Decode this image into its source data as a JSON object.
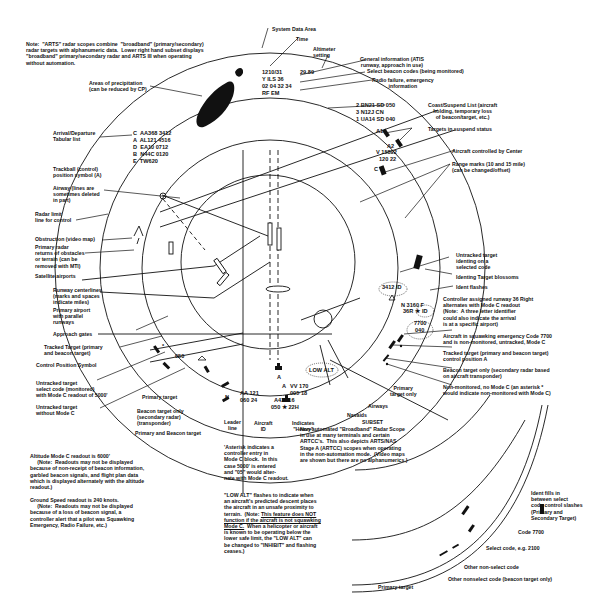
{
  "note": "Note:  \"ARTS\" radar scopes combine  \"broadband\" (primary/secondary)\nradar targets with alphanumeric data.  Lower right hand subset displays\n\"broadband\" primary/secondary radar and ARTS III when operating\nwithout automation.",
  "system_data": {
    "label": "System Data Area",
    "time_label": "Time",
    "altimeter_label": "Altimeter\nsetting",
    "time_value": "1210/31",
    "altimeter_value": "29.89",
    "line2": "Y ILS 36",
    "line3": "02 04 32 34",
    "line4": "RF EM",
    "general_info_label": "General information (ATIS\nrunway, approach in use)",
    "select_codes_label": "Select beacon codes (being monitored)",
    "radio_failure_label": "Radio failure, emergency\ninformation"
  },
  "precipitation_label": "Areas of precipitation\n(can be reduced by CP)",
  "tabular_list": {
    "label": "Arrival/Departure\nTabular list",
    "rows": [
      "C  AA368 3412",
      "A  AL121 4516",
      "D  EA10 0712",
      "B  N44C 0120",
      "E  TW620"
    ]
  },
  "coast_list": {
    "label": "Coast/Suspend List (aircraft\nholding, temporary loss\nof beacon/target, etc.)",
    "rows": [
      "2 BN21 SD 050",
      "3 N12J CN",
      "1 UA14 SD 040"
    ]
  },
  "suspend": {
    "label": "Targets in suspend status",
    "a1": "A1",
    "a2": "A2"
  },
  "center_aircraft": {
    "line1": "V 15892",
    "line2": "120 22",
    "pos": "C",
    "label": "Aircraft controlled by Center"
  },
  "range_marks_label": "Range marks (10 and 15 mile)\n(can be changed/offset)",
  "left_labels": {
    "trackball": "Trackball (control)\nposition symbol (A)",
    "airway": "Airway (lines are\nsometimes deleted\nin part)",
    "radar_limit": "Radar limit\nline for control",
    "obstruction": "Obstruction (video map)",
    "primary_returns": "Primary radar\nreturns of obstacles\nor terrain (can be\nremoved with MTI)",
    "satellite": "Satellite airports",
    "runway_centerlines": "Runway centerlines\n(marks and spaces\nindicate miles)",
    "primary_airport": "Primary airport\nwith parallel\nrunways",
    "approach_gates": "Approach gates",
    "tracked_target": "Tracked Target (primary\nand beacon target)",
    "control_position": "Control Position Symbol",
    "untracked_select": "Untracked target\nselect code (monitored)\nwith Mode C readout of 5000'",
    "untracked_no_c": "Untracked target\nwithout Mode C"
  },
  "right_labels": {
    "untracked_ident": "Untracked target\nidenting on a\nselected code",
    "blossoms": "Identing Target blossoms",
    "ident_flashes": "Ident flashes",
    "runway_assigned": "Controller assigned runway 36 Right\nalternates with Mode C readout\n(Note:  A three letter identifier\ncould also indicate the arrival\nis at a specific airport)",
    "emergency": "Aircraft in squawking emergency Code 7700\nand is non-monitored, untracked, Mode C",
    "tracked_a": "Tracked target (primary and beacon target)\ncontrol position A",
    "beacon_only": "Beacon target only (secondary radar based\non aircraft transponder)",
    "non_monitored": "Non-monitored, no Mode C (an asterisk *\nwould indicate non-monitored with Mode C)",
    "primary_only": "Primary\ntarget only",
    "airways": "Airways",
    "navaids": "Navaids"
  },
  "scope_tags": {
    "ident_3412": "3412 ID",
    "n3160": "N 3160 F",
    "r36": "36R ★",
    "id": "ID",
    "code7700": "7700",
    "alt040": "040",
    "low_alt": "LOW ALT",
    "vv_line1": "VV 170",
    "vv_line2": "005 18",
    "a_mark": "A",
    "f_mark": "F",
    "star": "*",
    "alt050": "050",
    "n_leader": "N",
    "aa121_line1": "AA 121",
    "aa121_line2": "060 24",
    "a42b_line1": "A42B16",
    "a42b_line2": "050 ★ 22H"
  },
  "bottom_labels": {
    "primary_target": "Primary target",
    "beacon_only": "Beacon target only\n(secondary radar)\n(transponder)",
    "primary_and_beacon": "Primary and Beacon target",
    "leader_line": "Leader\nline",
    "aircraft_id": "Aircraft\nID",
    "heavy": "Indicates\n\"Heavy\"",
    "asterisk_note": "'Asterisk indicates a\ncontroller entry in\nMode C block.  In this\ncase 5000' is entered\nand \"05\" would alter-\nnate with Mode C readout.",
    "altitude_note": "Altitude Mode C readout is 6000'\n     (Note:  Readouts may not be displayed\nbecause of non-receipt of beacon information,\ngarbled beacon signals, and flight plan data\nwhich is displayed alternately with the altitude\nreadout.)",
    "ground_speed_note": "Ground Speed readout is 240 knots.\n     (Note:  Readouts may not be displayed\nbecause of a loss of beacon signal, a\ncontroller alert that a pilot was Squawking\nEmergency, Radio Failure, etc.)",
    "low_alt_note_1": "\"LOW ALT\" flashes to indicate when\nan aircraft's predicted descent places\nthe aircraft in an unsafe proximity to\nterrain.  (Note: ",
    "low_alt_note_ul": "This feature does NOT\nfunction if the aircraft is not squawking\nMode C.",
    "low_alt_note_2": "  When a helicopter or aircraft\nis known to be operating below the\nlower safe limit, the \"LOW ALT\" can\nbe changed to \"INHIBIT\" and flashing\nceases.)"
  },
  "subset": {
    "title": "SUBSET",
    "text": "Non-automated \"Broadband\" Radar Scope\nin use at many terminals and certain\nARTCC's.  This also depicts ARTS/NAS\nStage A (ARTCC) scopes when operating\nin the non-automation mode.  (Video maps\nare shown but there are no alphanumerics.)",
    "ident_fills": "Ident fills in\nbetween select\ncode control slashes\n(Primary and\nSecondary Target)",
    "code7700": "Code 7700",
    "select_code": "Select code, e.g. 2100",
    "other_non_select": "Other non-select code",
    "other_nonselect_beacon": "Other nonselect code (beacon target only)",
    "primary_target": "Primary target"
  }
}
